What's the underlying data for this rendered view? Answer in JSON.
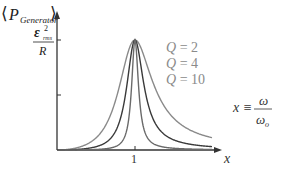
{
  "chart_data": {
    "type": "line",
    "title": "",
    "xlabel": "x",
    "ylabel": "⟨P_Generator⟩",
    "x_tick_labels": [
      "1"
    ],
    "y_tick_labels": [
      "ε²_rms / R"
    ],
    "series": [
      {
        "name": "Q = 2",
        "Q": 2,
        "color": "#8a8a8a"
      },
      {
        "name": "Q = 4",
        "Q": 4,
        "color": "#3a3a3a"
      },
      {
        "name": "Q = 10",
        "Q": 10,
        "color": "#6a6a6a"
      }
    ],
    "peak": {
      "x": 1,
      "y_label": "ε²_rms / R"
    },
    "annotation": "x ≡ ω / ω_o",
    "grid": false
  },
  "labels": {
    "y_axis_open": "⟨",
    "y_axis_P": "P",
    "y_axis_sub": "Generator",
    "y_axis_close": "⟩",
    "peak_num_eps": "ε",
    "peak_num_sup": "2",
    "peak_num_sub": "rms",
    "peak_den": "R",
    "legend": [
      "Q = 2",
      "Q = 4",
      "Q = 10"
    ],
    "x_tick": "1",
    "x_axis": "x",
    "def_lhs": "x ≡",
    "def_num": "ω",
    "def_den_omega": "ω",
    "def_den_sub": "o"
  }
}
